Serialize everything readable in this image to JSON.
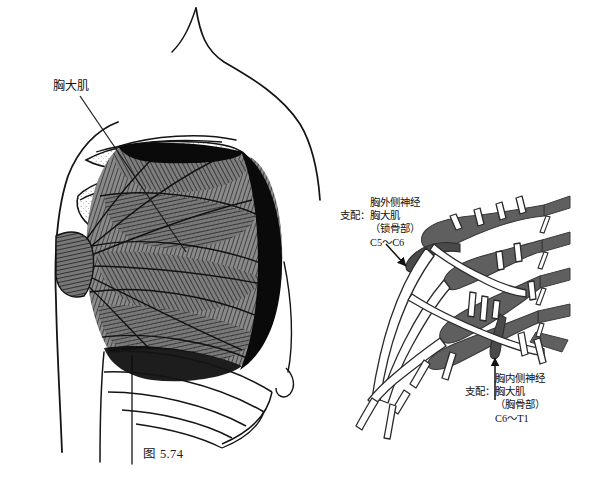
{
  "figure_left": {
    "caption": "图 5.74",
    "label_pectoralis": "胸大肌",
    "description": "胸大肌 anterior chest wall illustration"
  },
  "figure_right": {
    "caption": "图 5.75",
    "label_lateral_pectoral": {
      "nerve_name": "胸外侧神经",
      "innervates_prefix": "支配：",
      "innervates_muscle": "胸大肌",
      "part": "（锁骨部）",
      "roots": "C5～C6"
    },
    "label_medial_pectoral": {
      "nerve_name": "胸内侧神经",
      "innervates_prefix": "支配：",
      "innervates_muscle": "胸大肌",
      "part": "（胸骨部）",
      "roots": "C6～T1"
    },
    "root_labels": [
      "C5",
      "C6",
      "C7",
      "C8",
      "T1"
    ]
  },
  "colors": {
    "background": "#ffffff",
    "ink": "#111111",
    "nerve_gray": "#5f5f5f",
    "nerve_gray_dark": "#4a4a4a",
    "muscle_shade": "#6e6e6e",
    "muscle_shadow": "#0a0a0a",
    "bone_stipple": "#b9b9b9"
  }
}
